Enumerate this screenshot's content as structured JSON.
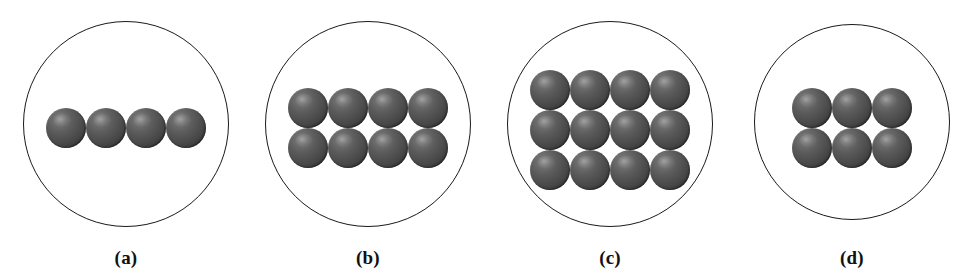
{
  "figure": {
    "type": "scientific-illustration",
    "background_color": "#ffffff",
    "circle_stroke_color": "#1a1a1a",
    "sphere_base_color": "#515151",
    "sphere_highlight_color": "#8e8e8e",
    "sphere_shadow_color": "#2b2b2b",
    "label_color": "#111111",
    "panel_count": 4,
    "total_spheres": 30
  },
  "panels": [
    {
      "id": "a",
      "label": "(a)",
      "rows": 1,
      "cols": 4,
      "sphere_count": 4,
      "arrangement": "1 x 4",
      "circle": {
        "cx": 126,
        "cy": 124,
        "diameter": 206
      },
      "sphere_diameter": 40,
      "grid_center_y": 128
    },
    {
      "id": "b",
      "label": "(b)",
      "rows": 2,
      "cols": 4,
      "sphere_count": 8,
      "arrangement": "2 x 4",
      "circle": {
        "cx": 368,
        "cy": 124,
        "diameter": 206
      },
      "sphere_diameter": 40,
      "grid_center_y": 128
    },
    {
      "id": "c",
      "label": "(c)",
      "rows": 3,
      "cols": 4,
      "sphere_count": 12,
      "arrangement": "3 x 4",
      "circle": {
        "cx": 610,
        "cy": 124,
        "diameter": 206
      },
      "sphere_diameter": 40,
      "grid_center_y": 130
    },
    {
      "id": "d",
      "label": "(d)",
      "rows": 2,
      "cols": 3,
      "sphere_count": 6,
      "arrangement": "2 x 3",
      "circle": {
        "cx": 852,
        "cy": 122,
        "diameter": 196
      },
      "sphere_diameter": 40,
      "grid_center_y": 128
    }
  ]
}
